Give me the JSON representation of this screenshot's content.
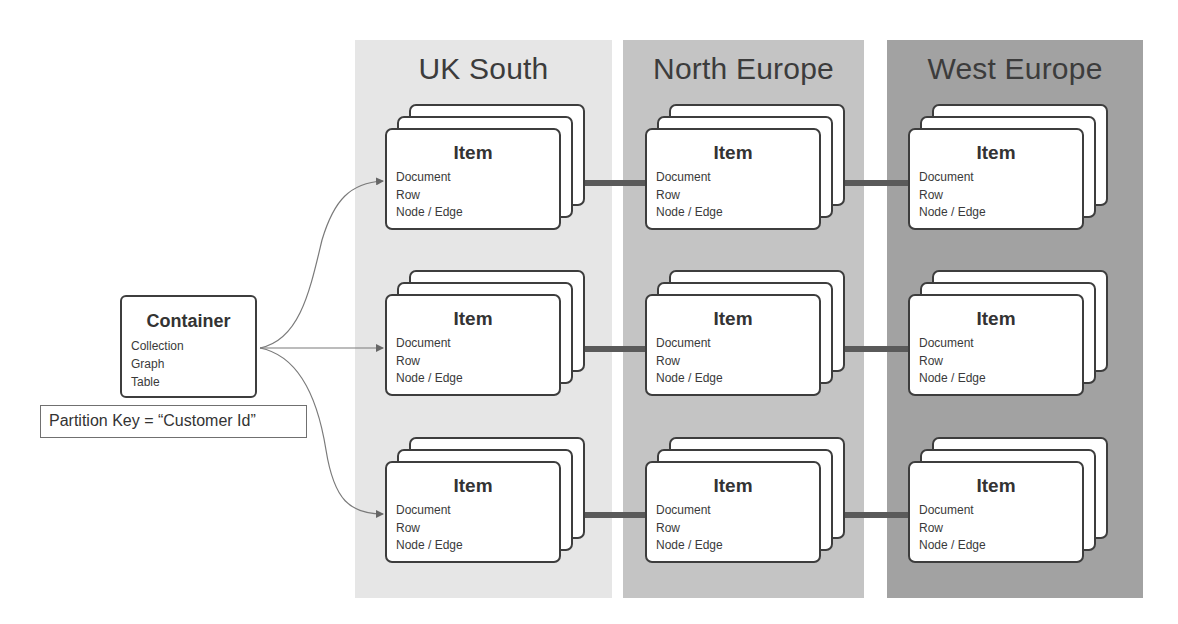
{
  "diagram": {
    "colors": {
      "region_uk_south": "#e6e6e6",
      "region_north_europe": "#c4c4c4",
      "region_west_europe": "#a2a2a2",
      "card_border": "#3d3d3d",
      "replication_link": "#5a5a5a",
      "arrow": "#777777"
    },
    "container": {
      "title": "Container",
      "types": [
        "Collection",
        "Graph",
        "Table"
      ]
    },
    "partition_key": {
      "label": "Partition Key = “Customer Id”"
    },
    "regions": [
      {
        "name": "UK South"
      },
      {
        "name": "North Europe"
      },
      {
        "name": "West Europe"
      }
    ],
    "item": {
      "title": "Item",
      "types": [
        "Document",
        "Row",
        "Node / Edge"
      ]
    },
    "rows": 3,
    "edges": [
      {
        "from": "Container",
        "to": "UK South / row 1",
        "style": "curved-arrow"
      },
      {
        "from": "Container",
        "to": "UK South / row 2",
        "style": "straight-arrow"
      },
      {
        "from": "Container",
        "to": "UK South / row 3",
        "style": "curved-arrow"
      },
      {
        "from": "UK South",
        "to": "North Europe",
        "style": "thick-line",
        "rows": [
          1,
          2,
          3
        ]
      },
      {
        "from": "North Europe",
        "to": "West Europe",
        "style": "thick-line",
        "rows": [
          1,
          2,
          3
        ]
      }
    ]
  }
}
